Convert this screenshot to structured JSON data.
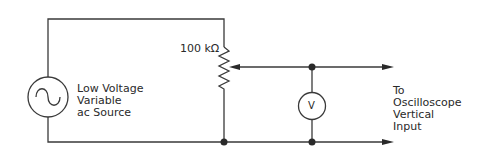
{
  "diagram": {
    "type": "circuit schematic",
    "components": {
      "source": {
        "label_lines": [
          "Low Voltage",
          "Variable",
          "ac Source"
        ],
        "symbol": "ac-sine-source"
      },
      "potentiometer": {
        "label": "100 kΩ",
        "symbol": "variable-resistor-with-wiper"
      },
      "voltmeter": {
        "label": "V",
        "symbol": "voltmeter-circle"
      },
      "output": {
        "label_lines": [
          "To",
          "Oscilloscope",
          "Vertical",
          "Input"
        ]
      }
    },
    "colors": {
      "line": "#3a3a3a",
      "background": "#ffffff",
      "text": "#2a2a2a"
    }
  }
}
